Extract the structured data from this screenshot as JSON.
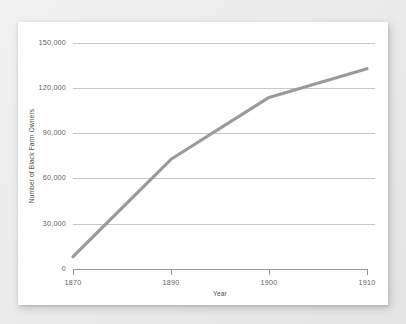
{
  "chart_data": {
    "type": "line",
    "title": "",
    "xlabel": "Year",
    "ylabel": "Number of Black Farm Owners",
    "x": [
      1870,
      1890,
      1900,
      1910
    ],
    "categories": [
      "1870",
      "1890",
      "1900",
      "1910"
    ],
    "values": [
      8500,
      73000,
      114000,
      133000
    ],
    "series": [
      {
        "name": "Number of Black Farm Owners",
        "values": [
          8500,
          73000,
          114000,
          133000
        ]
      }
    ],
    "ylim": [
      0,
      150000
    ],
    "ytick_values": [
      0,
      30000,
      60000,
      90000,
      120000,
      150000
    ],
    "ytick_labels": [
      "0",
      "30,000",
      "60,000",
      "90,000",
      "120,000",
      "150,000"
    ],
    "xtick_labels": [
      "1870",
      "1890",
      "1900",
      "1910"
    ],
    "grid": "horizontal",
    "legend": "none",
    "axis_spacing_note": "x ticks evenly spaced in pixels despite unequal year intervals",
    "colors": {
      "line": "#9a9a96",
      "gridline": "#b9b9b4",
      "axis": "#8e8e8a",
      "tick_text": "#63635f",
      "axis_title_text": "#4f4f4c",
      "card_background": "#fefefe",
      "page_background": "#ededed"
    }
  }
}
